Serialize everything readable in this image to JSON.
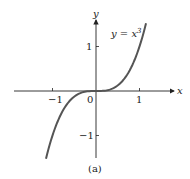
{
  "chart_data": {
    "type": "line",
    "title": "",
    "caption": "(a)",
    "xlabel": "x",
    "ylabel": "y",
    "xlim": [
      -1.3,
      1.3
    ],
    "ylim": [
      -1.6,
      1.6
    ],
    "grid": false,
    "x_ticks": [
      -1,
      0,
      1
    ],
    "x_tick_labels": [
      "−1",
      "0",
      "1"
    ],
    "y_ticks": [
      1,
      -1
    ],
    "y_tick_labels": [
      "1",
      "−1"
    ],
    "series": [
      {
        "name": "y = x³",
        "function": "x^3",
        "x": [
          -1.15,
          -1.0,
          -0.8,
          -0.6,
          -0.4,
          -0.2,
          0,
          0.2,
          0.4,
          0.6,
          0.8,
          1.0,
          1.15
        ],
        "values": [
          -1.52,
          -1.0,
          -0.512,
          -0.216,
          -0.064,
          -0.008,
          0,
          0.008,
          0.064,
          0.216,
          0.512,
          1.0,
          1.52
        ]
      }
    ],
    "annotations": [
      {
        "text": "y = x",
        "superscript": "3",
        "x": 0.35,
        "y": 1.3
      }
    ]
  }
}
